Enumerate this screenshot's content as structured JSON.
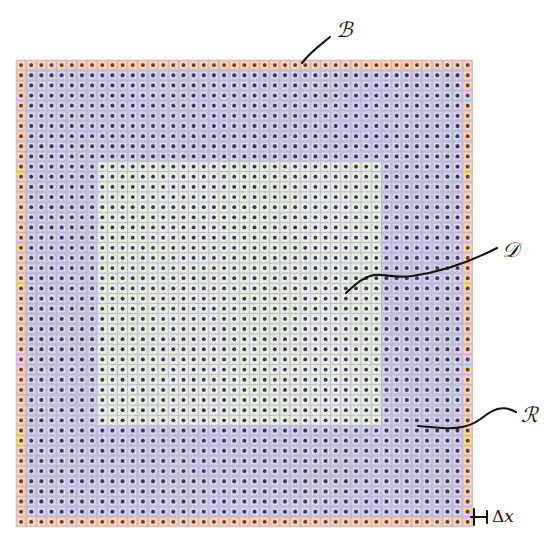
{
  "figure": {
    "type": "diagram",
    "canvas": {
      "width": 550,
      "height": 556,
      "background": "#ffffff"
    },
    "grid": {
      "origin_x": 16,
      "origin_y": 60,
      "cell_size": 10.15,
      "cols": 45,
      "rows": 46,
      "cell_border_color": "#b9b4cf",
      "cell_border_width": 0.6,
      "node_dot": {
        "radius": 1.9,
        "color": "#3b3355",
        "boundary_color": "#6b3a20"
      },
      "inner_square": {
        "inset": 2.2,
        "stroke": "#ffffff",
        "stroke_opacity": 0.5
      },
      "regions": [
        {
          "name": "boundary-ring",
          "symbol": "B",
          "fill": "#f2c3a7",
          "description": "outer one-cell-thick boundary ring",
          "ring_thickness": 1
        },
        {
          "name": "outer-domain",
          "symbol": "R",
          "fill": "#c3c2e2",
          "description": "lavender computational region",
          "col_start": 1,
          "col_end": 43,
          "row_start": 1,
          "row_end": 44
        },
        {
          "name": "inner-domain",
          "symbol": "D",
          "fill": "#dfe8d8",
          "description": "light green interior sub-domain",
          "col_start": 8,
          "col_end": 35,
          "row_start": 10,
          "row_end": 35
        }
      ]
    },
    "labels": [
      {
        "id": "label-B",
        "text": "ℬ",
        "plain": "B",
        "meaning": "boundary cells",
        "x": 336,
        "y": 20
      },
      {
        "id": "label-D",
        "text": "𝒟",
        "plain": "D",
        "meaning": "inner domain",
        "x": 502,
        "y": 240
      },
      {
        "id": "label-R",
        "text": "ℛ",
        "plain": "R",
        "meaning": "outer region",
        "x": 521,
        "y": 405
      },
      {
        "id": "label-dx",
        "delta": "Δ",
        "variable": "x",
        "meaning": "uniform grid spacing",
        "x": 492,
        "y": 508
      }
    ],
    "leaders": [
      {
        "name": "leader-B",
        "path": "M 330 37 C 322 44, 312 50, 302 63",
        "stroke": "#17150f",
        "width": 2.1
      },
      {
        "name": "leader-D",
        "path": "M 497 248 C 470 262, 440 272, 412 276 C 392 279, 382 272, 370 276 C 358 280, 352 288, 346 293",
        "stroke": "#17150f",
        "width": 2.1
      },
      {
        "name": "leader-R",
        "path": "M 516 412 C 502 404, 492 410, 482 418 C 470 427, 458 429, 442 428 L 418 426",
        "stroke": "#17150f",
        "width": 2.1
      }
    ],
    "dimension_marker": {
      "name": "delta-x-tick",
      "path": "M 474 509 L 474 525 M 471 517 L 487 517 M 487 511 L 487 523",
      "stroke": "#17150f",
      "width": 2.0
    },
    "caption": {
      "text": "",
      "visible": false
    }
  },
  "colors": {
    "boundary": "#f2c3a7",
    "region": "#c3c2e2",
    "domain": "#dfe8d8",
    "ink": "#17150f",
    "gridline": "#b9b4cf",
    "node": "#3b3355"
  }
}
